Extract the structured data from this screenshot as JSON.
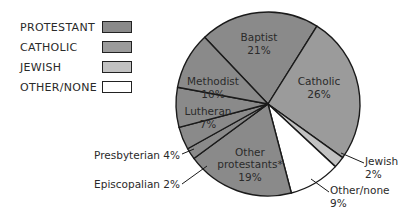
{
  "legend": {
    "items": [
      {
        "label": "PROTESTANT",
        "color": "#8a8a8a"
      },
      {
        "label": "CATHOLIC",
        "color": "#9b9b9b"
      },
      {
        "label": "JEWISH",
        "color": "#c2c2c2"
      },
      {
        "label": "OTHER/NONE",
        "color": "#ffffff"
      }
    ]
  },
  "labels": {
    "baptist_name": "Baptist",
    "baptist_pct": "21%",
    "catholic_name": "Catholic",
    "catholic_pct": "26%",
    "methodist_name": "Methodist",
    "methodist_pct": "10%",
    "lutheran_name": "Lutheran",
    "lutheran_pct": "7%",
    "other_prot_line1": "Other",
    "other_prot_line2": "protestants*",
    "other_prot_pct": "19%",
    "presbyterian": "Presbyterian 4%",
    "episcopalian": "Episcopalian 2%",
    "jewish_name": "Jewish",
    "jewish_pct": "2%",
    "othernone_name": "Other/none",
    "othernone_pct": "9%"
  },
  "chart_data": {
    "type": "pie",
    "title": "",
    "categories": [
      "Baptist",
      "Catholic",
      "Jewish",
      "Other/none",
      "Other protestants*",
      "Episcopalian",
      "Presbyterian",
      "Lutheran",
      "Methodist"
    ],
    "values": [
      21,
      26,
      2,
      9,
      19,
      2,
      4,
      7,
      10
    ],
    "groups": [
      "PROTESTANT",
      "CATHOLIC",
      "JEWISH",
      "OTHER/NONE",
      "PROTESTANT",
      "PROTESTANT",
      "PROTESTANT",
      "PROTESTANT",
      "PROTESTANT"
    ],
    "legend": [
      "PROTESTANT",
      "CATHOLIC",
      "JEWISH",
      "OTHER/NONE"
    ],
    "legend_position": "top-left",
    "unit": "%"
  }
}
